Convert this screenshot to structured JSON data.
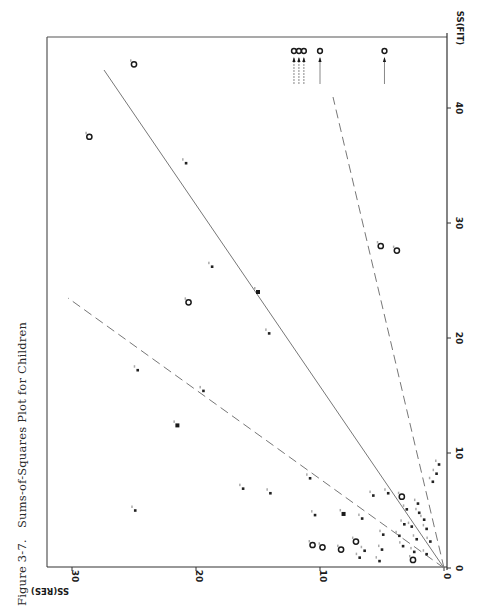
{
  "caption": {
    "figure_number": "Figure 3-7.",
    "title": "Sums-of-Squares Plot for Children"
  },
  "axes": {
    "x_title": "SS(FIT)",
    "y_title": "SS(RES)",
    "x_ticks": [
      "0",
      "10",
      "20",
      "30",
      "40"
    ],
    "y_ticks": [
      "0",
      "10",
      "20",
      "30"
    ]
  },
  "colors": {
    "ink": "#1a1a1a",
    "frame": "#555555",
    "line": "#777777",
    "paper": "#ffffff"
  },
  "chart_data": {
    "type": "scatter",
    "title": "Sums-of-Squares Plot for Children",
    "subtitle": "Figure 3-7.",
    "xlabel": "SS(FIT)",
    "ylabel": "SS(RES)",
    "xlim": [
      0,
      46
    ],
    "ylim": [
      0,
      32
    ],
    "x_ticks": [
      0,
      10,
      20,
      30,
      40
    ],
    "y_ticks": [
      0,
      10,
      20,
      30
    ],
    "grid": false,
    "orientation_note": "page rotated 90 degrees counter-clockwise",
    "reference_lines": [
      {
        "name": "solid line",
        "style": "solid",
        "slope": 0.63,
        "from": [
          0,
          0
        ],
        "to": [
          43.3,
          27.4
        ]
      },
      {
        "name": "steep dashed line",
        "style": "dashed",
        "slope": 1.29,
        "from": [
          0,
          0
        ],
        "to": [
          23.5,
          30.3
        ]
      },
      {
        "name": "shallow dashed line",
        "style": "dashed",
        "slope": 0.22,
        "from": [
          0,
          0
        ],
        "to": [
          41.0,
          9.0
        ]
      }
    ],
    "points": [
      {
        "x": 43.8,
        "y": 25.0,
        "marker": "circle"
      },
      {
        "x": 37.5,
        "y": 28.6,
        "marker": "circle"
      },
      {
        "x": 35.2,
        "y": 20.8,
        "marker": "dot"
      },
      {
        "x": 26.2,
        "y": 18.7,
        "marker": "dot"
      },
      {
        "x": 24.0,
        "y": 15.0,
        "marker": "square"
      },
      {
        "x": 23.1,
        "y": 20.6,
        "marker": "circle"
      },
      {
        "x": 28.0,
        "y": 5.1,
        "marker": "circle"
      },
      {
        "x": 27.6,
        "y": 3.8,
        "marker": "circle"
      },
      {
        "x": 20.4,
        "y": 14.1,
        "marker": "dot"
      },
      {
        "x": 17.2,
        "y": 24.7,
        "marker": "dot"
      },
      {
        "x": 15.4,
        "y": 19.4,
        "marker": "dot"
      },
      {
        "x": 12.4,
        "y": 21.5,
        "marker": "square"
      },
      {
        "x": 7.8,
        "y": 10.8,
        "marker": "dot"
      },
      {
        "x": 6.9,
        "y": 16.2,
        "marker": "dot"
      },
      {
        "x": 6.5,
        "y": 14.0,
        "marker": "dot"
      },
      {
        "x": 5.0,
        "y": 24.9,
        "marker": "dot"
      },
      {
        "x": 4.6,
        "y": 10.4,
        "marker": "dot"
      },
      {
        "x": 4.7,
        "y": 8.1,
        "marker": "square"
      },
      {
        "x": 4.3,
        "y": 6.6,
        "marker": "dot"
      },
      {
        "x": 6.3,
        "y": 5.7,
        "marker": "dot"
      },
      {
        "x": 6.5,
        "y": 4.5,
        "marker": "dot"
      },
      {
        "x": 6.2,
        "y": 3.4,
        "marker": "circle"
      },
      {
        "x": 5.6,
        "y": 2.1,
        "marker": "dot"
      },
      {
        "x": 5.1,
        "y": 3.0,
        "marker": "dot"
      },
      {
        "x": 4.8,
        "y": 2.0,
        "marker": "dot"
      },
      {
        "x": 4.2,
        "y": 1.6,
        "marker": "dot"
      },
      {
        "x": 3.8,
        "y": 3.2,
        "marker": "dot"
      },
      {
        "x": 3.6,
        "y": 2.6,
        "marker": "dot"
      },
      {
        "x": 3.4,
        "y": 1.4,
        "marker": "dot"
      },
      {
        "x": 2.9,
        "y": 4.9,
        "marker": "dot"
      },
      {
        "x": 2.8,
        "y": 3.6,
        "marker": "dot"
      },
      {
        "x": 2.5,
        "y": 2.2,
        "marker": "dot"
      },
      {
        "x": 2.3,
        "y": 1.1,
        "marker": "dot"
      },
      {
        "x": 1.9,
        "y": 3.3,
        "marker": "dot"
      },
      {
        "x": 1.6,
        "y": 5.0,
        "marker": "dot"
      },
      {
        "x": 1.5,
        "y": 6.4,
        "marker": "dot"
      },
      {
        "x": 1.4,
        "y": 2.4,
        "marker": "dot"
      },
      {
        "x": 1.2,
        "y": 1.4,
        "marker": "dot"
      },
      {
        "x": 2.3,
        "y": 7.1,
        "marker": "circle"
      },
      {
        "x": 1.6,
        "y": 8.3,
        "marker": "circle"
      },
      {
        "x": 1.8,
        "y": 9.8,
        "marker": "circle"
      },
      {
        "x": 2.0,
        "y": 10.6,
        "marker": "circle"
      },
      {
        "x": 0.9,
        "y": 6.8,
        "marker": "dot"
      },
      {
        "x": 0.6,
        "y": 5.2,
        "marker": "dot"
      },
      {
        "x": 0.7,
        "y": 2.5,
        "marker": "circle"
      },
      {
        "x": 8.2,
        "y": 0.6,
        "marker": "dot"
      },
      {
        "x": 7.5,
        "y": 0.9,
        "marker": "dot"
      },
      {
        "x": 9.0,
        "y": 0.4,
        "marker": "dot"
      }
    ],
    "off_scale_points": [
      {
        "x_gt": 46,
        "y": 12.1,
        "marker": "circle",
        "note": "arrow pointing up"
      },
      {
        "x_gt": 46,
        "y": 11.7,
        "marker": "circle",
        "note": "arrow pointing up"
      },
      {
        "x_gt": 46,
        "y": 11.3,
        "marker": "circle",
        "note": "arrow pointing up"
      },
      {
        "x_gt": 46,
        "y": 10.0,
        "marker": "circle",
        "note": "arrow pointing up"
      },
      {
        "x_gt": 46,
        "y": 4.8,
        "marker": "circle",
        "note": "arrow pointing up"
      }
    ]
  }
}
